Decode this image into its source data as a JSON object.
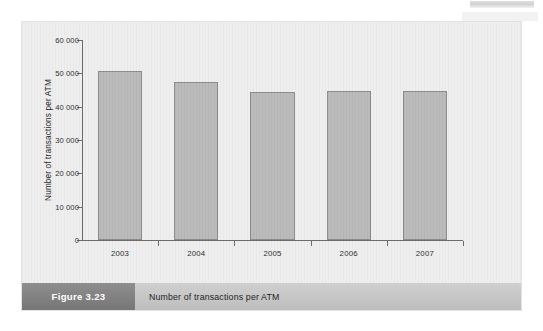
{
  "figure": {
    "number_label": "Figure 3.23",
    "caption": "Number of transactions per ATM"
  },
  "chart_data": {
    "type": "bar",
    "title": "",
    "xlabel": "",
    "ylabel": "Number of transactions per ATM",
    "categories": [
      "2003",
      "2004",
      "2005",
      "2006",
      "2007"
    ],
    "values": [
      50800,
      47300,
      44500,
      44600,
      44600
    ],
    "ylim": [
      0,
      60000
    ],
    "ytick_step": 10000,
    "ytick_labels": [
      "0",
      "10 000",
      "20 000",
      "30 000",
      "40 000",
      "50 000",
      "60 000"
    ],
    "ytick_values": [
      0,
      10000,
      20000,
      30000,
      40000,
      50000,
      60000
    ],
    "grid": false,
    "legend": "none",
    "series": [
      {
        "name": "Number of transactions per ATM",
        "values": [
          50800,
          47300,
          44500,
          44600,
          44600
        ]
      }
    ],
    "bar_fill_color": "#b9b9b9",
    "bar_border_color": "#8a8a8a",
    "axis_color": "#6a6a6a",
    "plot_background_color": "#eeeeee"
  },
  "colors": {
    "figure_number_background": "#818181",
    "caption_background": "#c6c6c6",
    "figure_number_text": "#ffffff",
    "caption_text": "#1f1f1f"
  }
}
